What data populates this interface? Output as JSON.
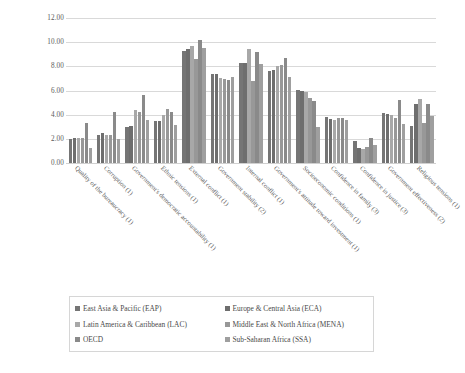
{
  "chart_data": {
    "type": "bar",
    "title": "",
    "subtitle": "",
    "xlabel": "",
    "ylabel": "",
    "ylim": [
      0,
      12
    ],
    "ytick_labels": [
      "12.00",
      "10.00",
      "8.00",
      "6.00",
      "4.00",
      "2.00",
      "0.00"
    ],
    "ytick_values": [
      12,
      10,
      8,
      6,
      4,
      2,
      0
    ],
    "ytick_step": 2,
    "grid": true,
    "legend_position": "bottom",
    "orientation": "vertical",
    "grouping": "clustered",
    "categories": [
      "Quality of the bureaucracy (1)",
      "Corruption (1)",
      "Government's democratic accountability (1)",
      "Ethnic tensions (1)",
      "External conflict (1)",
      "Government stability (2)",
      "Internal conflict (1)",
      "Government's attitude toward investment (1)",
      "Socioeconomic conditions (1)",
      "Confidence in family (3)",
      "Confidence in justice (3)",
      "Government effectiveness (2)",
      "Religious tensions (1)"
    ],
    "series": [
      {
        "name": "East Asia & Pacific (EAP)",
        "color": "#757575",
        "values": [
          2.0,
          2.35,
          3.0,
          3.45,
          9.3,
          7.4,
          8.25,
          7.65,
          6.05,
          3.8,
          1.85,
          4.1,
          3.1
        ]
      },
      {
        "name": "Europe & Central Asia (ECA)",
        "color": "#6e6e6e",
        "values": [
          2.05,
          2.45,
          3.05,
          3.5,
          9.4,
          7.35,
          8.3,
          7.7,
          6.0,
          3.65,
          1.25,
          4.05,
          4.9
        ]
      },
      {
        "name": "Latin America & Caribbean (LAC)",
        "color": "#a8a8a8",
        "values": [
          2.1,
          2.3,
          4.4,
          4.0,
          9.7,
          7.0,
          9.4,
          8.05,
          5.85,
          3.6,
          1.15,
          3.95,
          5.3
        ]
      },
      {
        "name": "Middle East & North Africa (MENA)",
        "color": "#989898",
        "values": [
          2.05,
          2.3,
          4.25,
          4.5,
          8.6,
          6.95,
          6.8,
          8.1,
          5.4,
          3.75,
          1.3,
          3.7,
          3.3
        ]
      },
      {
        "name": "OECD",
        "color": "#8a8a8a",
        "values": [
          3.3,
          4.2,
          5.65,
          4.2,
          10.2,
          6.9,
          9.15,
          8.7,
          5.1,
          3.7,
          2.05,
          5.2,
          4.85
        ]
      },
      {
        "name": "Sub-Saharan Africa (SSA)",
        "color": "#9f9f9f",
        "values": [
          1.25,
          2.0,
          3.55,
          3.15,
          9.55,
          7.15,
          8.2,
          7.1,
          3.0,
          3.6,
          1.5,
          3.25,
          3.9
        ]
      }
    ],
    "extra_bars": {
      "note": "group 9 and 10 contain one tall bar each",
      "confidence_in_family_tall": 9.9,
      "confidence_in_justice_tall": 7.95
    }
  },
  "legend": {
    "rows": [
      [
        {
          "label": "East Asia & Pacific (EAP)",
          "color": "#757575"
        },
        {
          "label": "Europe & Central Asia (ECA)",
          "color": "#6e6e6e"
        }
      ],
      [
        {
          "label": "Latin America & Caribbean (LAC)",
          "color": "#a8a8a8"
        },
        {
          "label": "Middle East & North Africa (MENA)",
          "color": "#989898"
        }
      ],
      [
        {
          "label": "OECD",
          "color": "#8a8a8a"
        },
        {
          "label": "Sub-Saharan Africa (SSA)",
          "color": "#9f9f9f"
        }
      ]
    ]
  }
}
